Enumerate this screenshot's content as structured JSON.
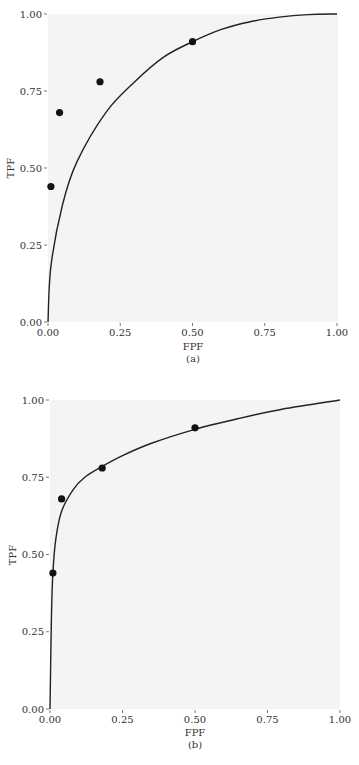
{
  "chart_data": [
    {
      "type": "scatter",
      "panel_label": "(a)",
      "xlabel": "FPF",
      "ylabel": "TPF",
      "xlim": [
        0,
        1
      ],
      "ylim": [
        0,
        1
      ],
      "xticks": [
        "0.00",
        "0.25",
        "0.50",
        "0.75",
        "1.00"
      ],
      "yticks": [
        "0.00",
        "0.25",
        "0.50",
        "0.75",
        "1.00"
      ],
      "grid": false,
      "points": [
        {
          "x": 0.01,
          "y": 0.44
        },
        {
          "x": 0.04,
          "y": 0.68
        },
        {
          "x": 0.18,
          "y": 0.78
        },
        {
          "x": 0.5,
          "y": 0.91
        }
      ],
      "curve": {
        "description": "smooth concave ROC curve from (0,0) to (1,1) passing near (0.5,0.91)",
        "x": [
          0,
          0.01,
          0.05,
          0.1,
          0.2,
          0.3,
          0.4,
          0.5,
          0.6,
          0.7,
          0.8,
          0.9,
          1.0
        ],
        "y": [
          0,
          0.18,
          0.38,
          0.52,
          0.68,
          0.78,
          0.86,
          0.91,
          0.95,
          0.975,
          0.99,
          0.998,
          1.0
        ]
      }
    },
    {
      "type": "scatter",
      "panel_label": "(b)",
      "xlabel": "FPF",
      "ylabel": "TPF",
      "xlim": [
        0,
        1
      ],
      "ylim": [
        0,
        1
      ],
      "xticks": [
        "0.00",
        "0.25",
        "0.50",
        "0.75",
        "1.00"
      ],
      "yticks": [
        "0.00",
        "0.25",
        "0.50",
        "0.75",
        "1.00"
      ],
      "grid": false,
      "points": [
        {
          "x": 0.01,
          "y": 0.44
        },
        {
          "x": 0.04,
          "y": 0.68
        },
        {
          "x": 0.18,
          "y": 0.78
        },
        {
          "x": 0.5,
          "y": 0.91
        }
      ],
      "curve": {
        "description": "fitted ROC curve rising steeply near FPF=0, passing through data points, ending at (1,1)",
        "x": [
          0,
          0.005,
          0.01,
          0.02,
          0.04,
          0.08,
          0.12,
          0.18,
          0.25,
          0.35,
          0.5,
          0.65,
          0.8,
          1.0
        ],
        "y": [
          0,
          0.3,
          0.44,
          0.55,
          0.64,
          0.71,
          0.75,
          0.785,
          0.82,
          0.86,
          0.905,
          0.94,
          0.97,
          1.0
        ]
      }
    }
  ]
}
